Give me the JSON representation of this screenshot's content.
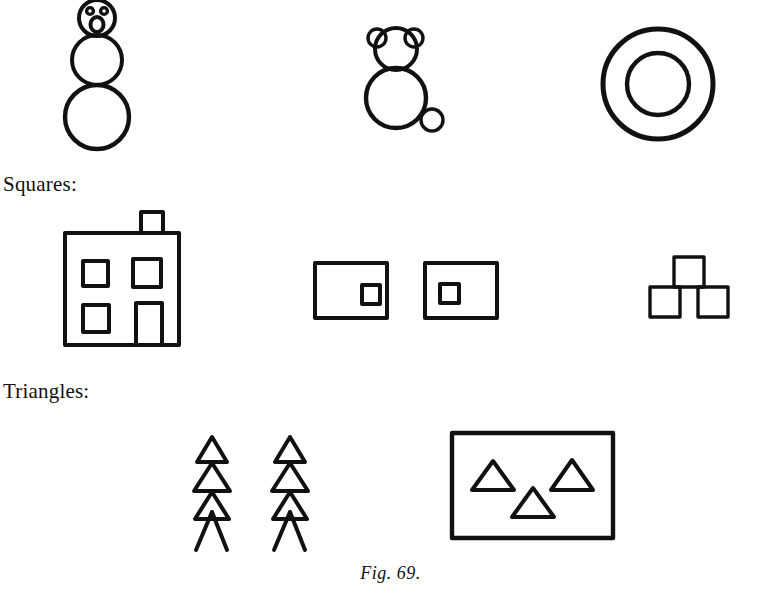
{
  "page": {
    "background_color": "#ffffff",
    "ink_color": "#111111",
    "width": 781,
    "height": 597
  },
  "labels": {
    "squares": "Squares:",
    "triangles": "Triangles:"
  },
  "caption": {
    "text": "Fig. 69."
  },
  "figure": {
    "title": "Fig. 69.",
    "rows": [
      {
        "name": "circles",
        "label": "",
        "drawings": [
          {
            "name": "snowman",
            "parts": [
              "head-circle",
              "eye-left",
              "eye-right",
              "mouth-oval",
              "torso-circle",
              "base-circle"
            ]
          },
          {
            "name": "bear",
            "parts": [
              "ear-left-circle",
              "ear-right-circle",
              "head-circle",
              "body-circle",
              "tail-circle"
            ]
          },
          {
            "name": "concentric-rings",
            "parts": [
              "outer-circle",
              "inner-circle"
            ]
          }
        ]
      },
      {
        "name": "squares",
        "label": "Squares:",
        "drawings": [
          {
            "name": "house",
            "parts": [
              "body-square",
              "chimney",
              "window-top-left",
              "window-top-right",
              "window-bottom-left",
              "door"
            ]
          },
          {
            "name": "rectangle-pair",
            "parts": [
              "rectangle-left",
              "small-square-inside-right",
              "rectangle-right",
              "small-square-inside-left"
            ]
          },
          {
            "name": "three-squares-pyramid",
            "parts": [
              "square-top",
              "square-bottom-left",
              "square-bottom-right"
            ]
          }
        ]
      },
      {
        "name": "triangles",
        "label": "Triangles:",
        "drawings": [
          {
            "name": "fir-tree-left",
            "parts": [
              "triangle-top",
              "triangle-middle",
              "triangle-bottom",
              "leg-left",
              "leg-right"
            ]
          },
          {
            "name": "fir-tree-right",
            "parts": [
              "triangle-top",
              "triangle-middle",
              "triangle-bottom",
              "leg-left",
              "leg-right"
            ]
          },
          {
            "name": "framed-triangles",
            "parts": [
              "frame-rectangle",
              "triangle-upper-left",
              "triangle-upper-right",
              "triangle-lower-center"
            ]
          }
        ]
      }
    ]
  }
}
